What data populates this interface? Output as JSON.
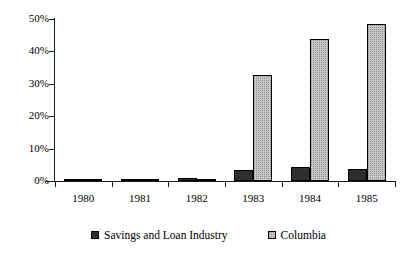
{
  "chart_data": {
    "type": "bar",
    "title": "",
    "subtitle": "",
    "xlabel": "",
    "ylabel": "",
    "categories": [
      "1980",
      "1981",
      "1982",
      "1983",
      "1984",
      "1985"
    ],
    "series": [
      {
        "name": "Savings and Loan Industry",
        "color": "#2e2e2e",
        "values": [
          0.5,
          0.4,
          1.0,
          3.5,
          4.4,
          3.8
        ]
      },
      {
        "name": "Columbia",
        "color": "#c9c9c9",
        "values": [
          0.1,
          0.05,
          0.6,
          32.7,
          43.8,
          48.5
        ]
      }
    ],
    "ylim": [
      0,
      50
    ],
    "yticks": [
      0,
      10,
      20,
      30,
      40,
      50
    ],
    "ytick_labels": [
      "0%",
      "10%",
      "20%",
      "30%",
      "40%",
      "50%"
    ],
    "grid": false,
    "legend_position": "bottom-center"
  },
  "legend": {
    "items": [
      {
        "label": "Savings and Loan Industry"
      },
      {
        "label": "Columbia"
      }
    ]
  }
}
